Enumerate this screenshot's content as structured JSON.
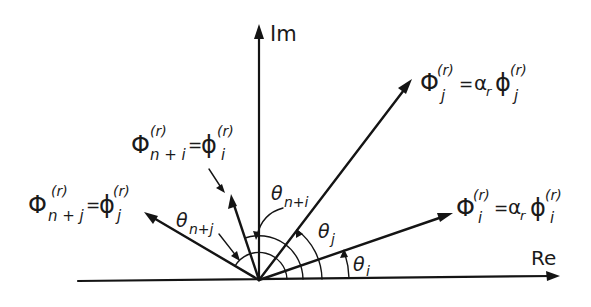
{
  "diagram": {
    "type": "complex-plane phasor diagram",
    "axes": {
      "real_label": "Re",
      "imag_label": "Im"
    },
    "vectors": [
      {
        "id": "phi_i",
        "lhs": "Φ",
        "lhs_sub": "i",
        "lhs_sup": "(r)",
        "eq": "=",
        "coef": "α",
        "coef_sub": "r",
        "rhs": "ϕ",
        "rhs_sub": "i",
        "rhs_sup": "(r)",
        "angle_label": "θ",
        "angle_sub": "i"
      },
      {
        "id": "phi_j",
        "lhs": "Φ",
        "lhs_sub": "j",
        "lhs_sup": "(r)",
        "eq": "=",
        "coef": "α",
        "coef_sub": "r",
        "rhs": "ϕ",
        "rhs_sub": "j",
        "rhs_sup": "(r)",
        "angle_label": "θ",
        "angle_sub": "j"
      },
      {
        "id": "phi_n_plus_i",
        "lhs": "Φ",
        "lhs_sub": "n + i",
        "lhs_sup": "(r)",
        "eq": "=",
        "rhs": "ϕ",
        "rhs_sub": "i",
        "rhs_sup": "(r)",
        "angle_label": "θ",
        "angle_sub": "n+i"
      },
      {
        "id": "phi_n_plus_j",
        "lhs": "Φ",
        "lhs_sub": "n + j",
        "lhs_sup": "(r)",
        "eq": "=",
        "rhs": "ϕ",
        "rhs_sub": "j",
        "rhs_sup": "(r)",
        "angle_label": "θ",
        "angle_sub": "n+j"
      }
    ]
  }
}
